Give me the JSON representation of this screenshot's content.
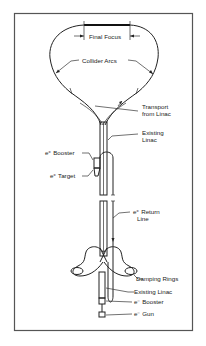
{
  "figure": {
    "labels": {
      "final_focus": "Final Focus",
      "collider_arcs": "Collider Arcs",
      "transport_line1": "Transport",
      "transport_line2": "from Linac",
      "existing_linac_top_line1": "Existing",
      "existing_linac_top_line2": "Linac",
      "positron_booster": "e⁺ Booster",
      "positron_target": "e⁺ Target",
      "positron_return_line1": "e⁺ Return",
      "positron_return_line2": "Line",
      "damping_rings": "Damping Rings",
      "existing_linac_bottom": "Existing Linac",
      "electron_booster": "e⁻ Booster",
      "electron_gun": "e⁻ Gun"
    },
    "colors": {
      "line": "#222222",
      "background": "#ffffff",
      "frame": "#555555"
    }
  }
}
